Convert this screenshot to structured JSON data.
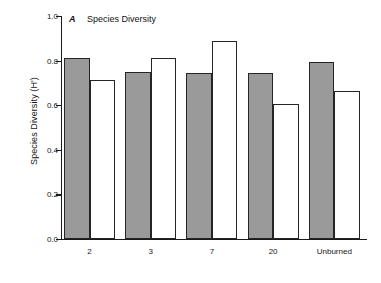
{
  "figure": {
    "panel_letter": "A",
    "panel_title": "Species Diversity"
  },
  "chart_data": {
    "type": "bar",
    "title": "A   Species Diversity",
    "xlabel": "",
    "ylabel": "Species Diversity (H')",
    "ylim": [
      0.0,
      1.0
    ],
    "yticks": [
      "0.0",
      "0.2",
      "0.4",
      "0.6",
      "0.8",
      "1.0"
    ],
    "ytick_values": [
      0.0,
      0.2,
      0.4,
      0.6,
      0.8,
      1.0
    ],
    "grid": false,
    "legend": "none",
    "categories": [
      "2",
      "3",
      "7",
      "20",
      "Unburned"
    ],
    "series": [
      {
        "name": "shaded",
        "fill": "#9a9a9a",
        "values": [
          0.81,
          0.75,
          0.745,
          0.745,
          0.795
        ]
      },
      {
        "name": "open",
        "fill": "#ffffff",
        "values": [
          0.715,
          0.81,
          0.89,
          0.605,
          0.665
        ]
      }
    ]
  },
  "colors": {
    "shaded_bar": "#9a9a9a",
    "open_bar": "#ffffff",
    "bar_outline": "#252525",
    "axis": "#1a1a1a",
    "text": "#161616",
    "background": "#ffffff"
  }
}
